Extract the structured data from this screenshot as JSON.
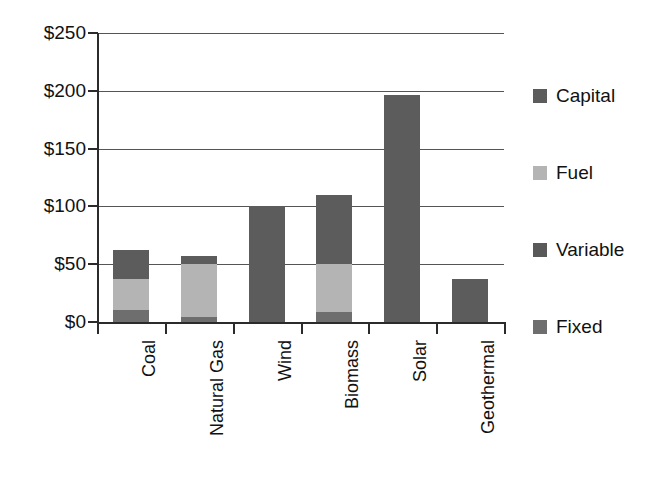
{
  "chart_data": {
    "type": "bar",
    "subtype": "stacked-bar",
    "title": "",
    "xlabel": "",
    "ylabel": "",
    "categories": [
      "Coal",
      "Natural Gas",
      "Wind",
      "Biomass",
      "Solar",
      "Geothermal"
    ],
    "series": [
      {
        "name": "Fixed",
        "color": "#6e6e6e",
        "values": [
          10,
          4,
          0,
          9,
          0,
          0
        ]
      },
      {
        "name": "Variable",
        "color": "#595959",
        "values": [
          0,
          0,
          0,
          0,
          0,
          0
        ]
      },
      {
        "name": "Fuel",
        "color": "#b4b4b4",
        "values": [
          27,
          46,
          0,
          41,
          0,
          0
        ]
      },
      {
        "name": "Capital",
        "color": "#5c5c5c",
        "values": [
          25,
          7,
          100,
          60,
          196,
          37
        ]
      }
    ],
    "totals": [
      62,
      57,
      100,
      110,
      196,
      37
    ],
    "ylim": [
      0,
      250
    ],
    "ytick_values": [
      0,
      50,
      100,
      150,
      200,
      250
    ],
    "ytick_labels": [
      "$0",
      "$50",
      "$100",
      "$150",
      "$200",
      "$250"
    ],
    "grid": true,
    "grid_axis": "y",
    "legend_position": "right",
    "legend_order": [
      "Capital",
      "Fuel",
      "Variable",
      "Fixed"
    ],
    "currency_prefix": "$",
    "units": "dollars per MWh"
  },
  "axis": {
    "y_labels": [
      {
        "text": "$250",
        "value": 250
      },
      {
        "text": "$200",
        "value": 200
      },
      {
        "text": "$150",
        "value": 150
      },
      {
        "text": "$100",
        "value": 100
      },
      {
        "text": "$50",
        "value": 50
      },
      {
        "text": "$0",
        "value": 0
      }
    ],
    "x_labels": [
      "Coal",
      "Natural Gas",
      "Wind",
      "Biomass",
      "Solar",
      "Geothermal"
    ]
  },
  "legend": {
    "items": [
      {
        "label": "Capital",
        "color": "#5c5c5c"
      },
      {
        "label": "Fuel",
        "color": "#b4b4b4"
      },
      {
        "label": "Variable",
        "color": "#595959"
      },
      {
        "label": "Fixed",
        "color": "#6e6e6e"
      }
    ]
  },
  "colors": {
    "capital": "#5c5c5c",
    "fuel": "#b4b4b4",
    "variable": "#595959",
    "fixed": "#6e6e6e",
    "axis": "#2b2b2b",
    "grid": "#555555",
    "text": "#111111",
    "background": "#ffffff"
  },
  "bars": [
    {
      "category": "Coal",
      "total": 62,
      "segments": [
        {
          "series": "Capital",
          "value": 25
        },
        {
          "series": "Fuel",
          "value": 27
        },
        {
          "series": "Fixed",
          "value": 10
        }
      ]
    },
    {
      "category": "Natural Gas",
      "total": 57,
      "segments": [
        {
          "series": "Capital",
          "value": 7
        },
        {
          "series": "Fuel",
          "value": 46
        },
        {
          "series": "Fixed",
          "value": 4
        }
      ]
    },
    {
      "category": "Wind",
      "total": 100,
      "segments": [
        {
          "series": "Capital",
          "value": 100
        }
      ]
    },
    {
      "category": "Biomass",
      "total": 110,
      "segments": [
        {
          "series": "Capital",
          "value": 60
        },
        {
          "series": "Fuel",
          "value": 41
        },
        {
          "series": "Fixed",
          "value": 9
        }
      ]
    },
    {
      "category": "Solar",
      "total": 196,
      "segments": [
        {
          "series": "Capital",
          "value": 196
        }
      ]
    },
    {
      "category": "Geothermal",
      "total": 37,
      "segments": [
        {
          "series": "Capital",
          "value": 37
        }
      ]
    }
  ]
}
